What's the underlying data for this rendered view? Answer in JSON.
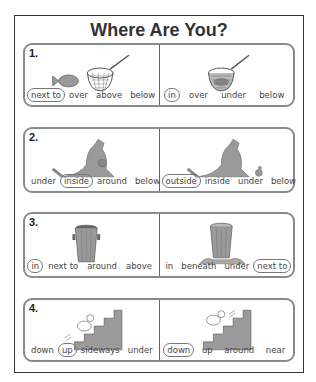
{
  "title": "Where Are You?",
  "rows": [
    {
      "number": "1.",
      "left": {
        "picture": "fish-next-to-net",
        "words": [
          "next to",
          "over",
          "above",
          "below"
        ],
        "circled": 0
      },
      "right": {
        "picture": "fish-in-net",
        "words": [
          "in",
          "over",
          "under",
          "below"
        ],
        "circled": 0
      }
    },
    {
      "number": "2.",
      "left": {
        "picture": "joey-inside-kangaroo-pouch",
        "words": [
          "under",
          "inside",
          "around",
          "below"
        ],
        "circled": 1
      },
      "right": {
        "picture": "joey-outside-kangaroo",
        "words": [
          "outside",
          "inside",
          "under",
          "below"
        ],
        "circled": 0
      }
    },
    {
      "number": "3.",
      "left": {
        "picture": "trash-in-can",
        "words": [
          "in",
          "next to",
          "around",
          "above"
        ],
        "circled": 0
      },
      "right": {
        "picture": "trash-next-to-can",
        "words": [
          "in",
          "beneath",
          "under",
          "next to"
        ],
        "circled": 3
      }
    },
    {
      "number": "4.",
      "left": {
        "picture": "duck-going-up-stairs",
        "words": [
          "down",
          "up",
          "sideways",
          "under"
        ],
        "circled": 1
      },
      "right": {
        "picture": "duck-going-down-stairs",
        "words": [
          "down",
          "up",
          "around",
          "near"
        ],
        "circled": 0
      }
    }
  ],
  "colors": {
    "border": "#8a8a8a",
    "picture_gray": "#9a9a9a",
    "text": "#444444"
  }
}
